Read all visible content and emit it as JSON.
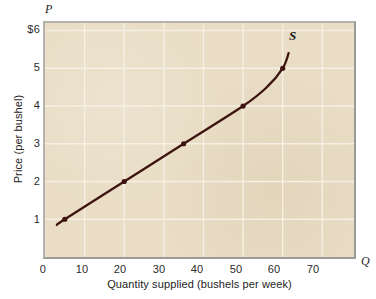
{
  "figure": {
    "background_color": "#ffffff",
    "plot_background_color": "#e9ddc5",
    "frame_color": "#9b9a96",
    "gridline_color": "#f7f2e6",
    "curve_color": "#3d1410",
    "text_color": "#232323"
  },
  "axes": {
    "p_letter": "P",
    "q_letter": "Q",
    "x_title": "Quantity supplied (bushels per week)",
    "y_title": "Price (per bushel)",
    "x_ticks": [
      "0",
      "10",
      "20",
      "30",
      "40",
      "50",
      "60",
      "70"
    ],
    "y_ticks": [
      "$6",
      "5",
      "4",
      "3",
      "2",
      "1"
    ]
  },
  "chart_data": {
    "type": "line",
    "title": "",
    "xlabel": "Quantity supplied (bushels per week)",
    "ylabel": "Price (per bushel)",
    "xlim": [
      0,
      78
    ],
    "ylim": [
      0,
      6.2
    ],
    "xticks": [
      0,
      10,
      20,
      30,
      40,
      50,
      60,
      70
    ],
    "yticks": [
      1,
      2,
      3,
      4,
      5,
      6
    ],
    "ytick_labels": [
      "1",
      "2",
      "3",
      "4",
      "5",
      "$6"
    ],
    "grid": true,
    "legend": "none",
    "series": [
      {
        "name": "S",
        "annotation": "S",
        "marker": "filled-circle",
        "points": [
          {
            "q": 5,
            "p": 1
          },
          {
            "q": 20,
            "p": 2
          },
          {
            "q": 35,
            "p": 3
          },
          {
            "q": 50,
            "p": 4
          },
          {
            "q": 60,
            "p": 5
          }
        ],
        "curve_path": [
          {
            "q": 3.0,
            "p": 0.85
          },
          {
            "q": 5.0,
            "p": 1.0
          },
          {
            "q": 20.0,
            "p": 2.0
          },
          {
            "q": 35.0,
            "p": 3.0
          },
          {
            "q": 50.0,
            "p": 4.0
          },
          {
            "q": 56.0,
            "p": 4.5
          },
          {
            "q": 60.0,
            "p": 5.0
          },
          {
            "q": 61.5,
            "p": 5.4
          }
        ]
      }
    ]
  }
}
